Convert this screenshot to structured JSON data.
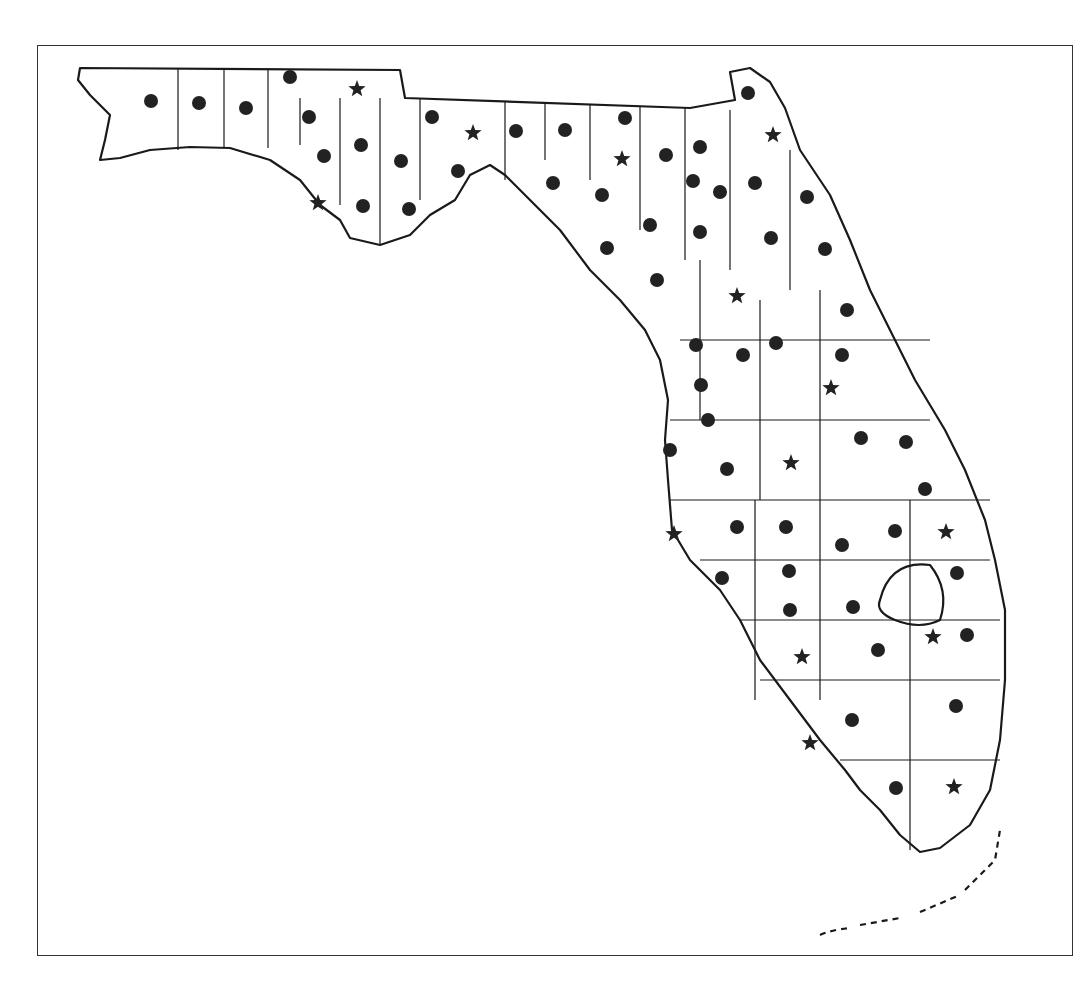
{
  "map": {
    "title": "Florida county map",
    "frame": {
      "x": 37,
      "y": 45,
      "width": 1036,
      "height": 911
    },
    "colors": {
      "outline": "#1a1a1a",
      "marker": "#222222",
      "background": "#ffffff"
    },
    "legend_symbols": {
      "dot": "circle-marker",
      "star": "star-marker"
    },
    "dots": [
      [
        151,
        101
      ],
      [
        199,
        103
      ],
      [
        246,
        108
      ],
      [
        290,
        77
      ],
      [
        309,
        117
      ],
      [
        324,
        156
      ],
      [
        361,
        145
      ],
      [
        401,
        161
      ],
      [
        363,
        206
      ],
      [
        409,
        209
      ],
      [
        432,
        117
      ],
      [
        458,
        171
      ],
      [
        516,
        131
      ],
      [
        565,
        130
      ],
      [
        625,
        118
      ],
      [
        666,
        155
      ],
      [
        700,
        147
      ],
      [
        553,
        183
      ],
      [
        602,
        195
      ],
      [
        650,
        225
      ],
      [
        607,
        248
      ],
      [
        700,
        232
      ],
      [
        693,
        181
      ],
      [
        720,
        192
      ],
      [
        755,
        183
      ],
      [
        807,
        197
      ],
      [
        771,
        238
      ],
      [
        825,
        249
      ],
      [
        657,
        280
      ],
      [
        847,
        310
      ],
      [
        696,
        345
      ],
      [
        743,
        355
      ],
      [
        776,
        343
      ],
      [
        842,
        355
      ],
      [
        701,
        385
      ],
      [
        708,
        420
      ],
      [
        727,
        469
      ],
      [
        861,
        438
      ],
      [
        906,
        442
      ],
      [
        670,
        450
      ],
      [
        925,
        489
      ],
      [
        737,
        527
      ],
      [
        786,
        527
      ],
      [
        842,
        545
      ],
      [
        895,
        531
      ],
      [
        957,
        573
      ],
      [
        722,
        578
      ],
      [
        789,
        571
      ],
      [
        790,
        610
      ],
      [
        853,
        607
      ],
      [
        967,
        635
      ],
      [
        878,
        650
      ],
      [
        852,
        720
      ],
      [
        956,
        706
      ],
      [
        748,
        93
      ],
      [
        896,
        788
      ]
    ],
    "stars": [
      [
        357,
        89
      ],
      [
        473,
        133
      ],
      [
        622,
        159
      ],
      [
        773,
        135
      ],
      [
        318,
        203
      ],
      [
        737,
        296
      ],
      [
        831,
        388
      ],
      [
        791,
        463
      ],
      [
        674,
        534
      ],
      [
        946,
        532
      ],
      [
        933,
        637
      ],
      [
        802,
        657
      ],
      [
        810,
        743
      ],
      [
        954,
        787
      ]
    ]
  }
}
